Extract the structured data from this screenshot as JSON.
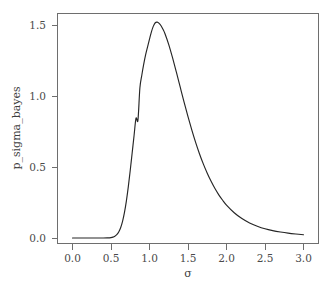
{
  "chart_data": {
    "type": "line",
    "title": "",
    "xlabel": "σ",
    "ylabel": "p_sigma_bayes",
    "xlim": [
      0.0,
      3.0
    ],
    "ylim": [
      0.0,
      1.6
    ],
    "grid": false,
    "legend": "none",
    "xticks": [
      "0.0",
      "0.5",
      "1.0",
      "1.5",
      "2.0",
      "2.5",
      "3.0"
    ],
    "xtick_values": [
      0.0,
      0.5,
      1.0,
      1.5,
      2.0,
      2.5,
      3.0
    ],
    "yticks": [
      "0.0",
      "0.5",
      "1.0",
      "1.5"
    ],
    "ytick_values": [
      0.0,
      0.5,
      1.0,
      1.5
    ],
    "line_color": "#262626",
    "axis_color": "#6e6e6e",
    "background_color": "#ffffff",
    "peak": {
      "x": 1.07,
      "y": 1.52
    },
    "series": [
      {
        "name": "p_sigma_bayes",
        "x": [
          0.0,
          0.05,
          0.1,
          0.15,
          0.2,
          0.25,
          0.3,
          0.35,
          0.4,
          0.45,
          0.5,
          0.525,
          0.55,
          0.575,
          0.6,
          0.625,
          0.65,
          0.675,
          0.7,
          0.725,
          0.75,
          0.775,
          0.8,
          0.825,
          0.85,
          0.875,
          0.9,
          0.925,
          0.95,
          0.975,
          1.0,
          1.025,
          1.05,
          1.075,
          1.1,
          1.125,
          1.15,
          1.175,
          1.2,
          1.25,
          1.3,
          1.35,
          1.4,
          1.45,
          1.5,
          1.55,
          1.6,
          1.65,
          1.7,
          1.75,
          1.8,
          1.85,
          1.9,
          1.95,
          2.0,
          2.1,
          2.2,
          2.3,
          2.4,
          2.5,
          2.6,
          2.7,
          2.8,
          2.9,
          3.0
        ],
        "y": [
          0.0,
          0.0,
          0.0,
          0.0,
          0.0,
          0.0,
          0.0,
          0.0,
          0.0,
          0.001,
          0.003,
          0.006,
          0.012,
          0.023,
          0.042,
          0.072,
          0.117,
          0.18,
          0.262,
          0.362,
          0.477,
          0.6,
          0.724,
          0.844,
          0.83,
          1.056,
          1.146,
          1.224,
          1.291,
          1.346,
          1.4,
          1.452,
          1.492,
          1.516,
          1.52,
          1.512,
          1.495,
          1.47,
          1.44,
          1.362,
          1.268,
          1.166,
          1.06,
          0.955,
          0.855,
          0.76,
          0.672,
          0.592,
          0.52,
          0.456,
          0.399,
          0.348,
          0.304,
          0.266,
          0.232,
          0.178,
          0.137,
          0.106,
          0.083,
          0.065,
          0.052,
          0.042,
          0.034,
          0.028,
          0.023
        ]
      }
    ]
  },
  "axes": {
    "ylabel": "p_sigma_bayes",
    "xlabel": "σ"
  }
}
